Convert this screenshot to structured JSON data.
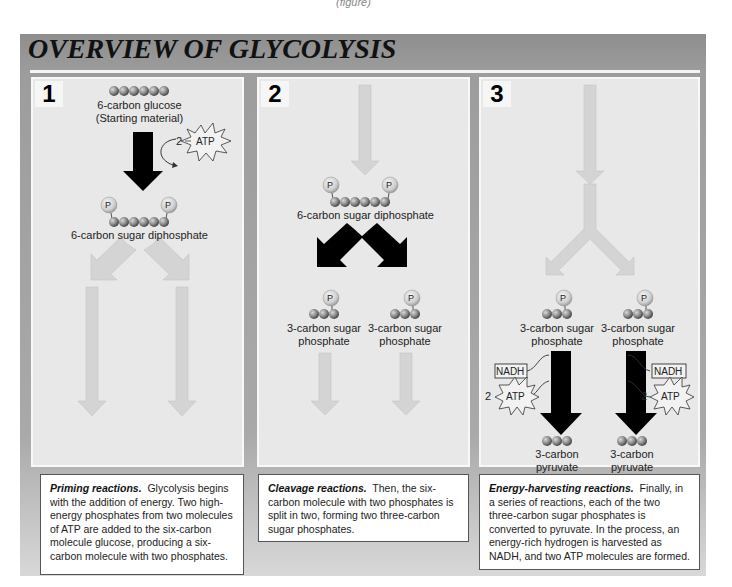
{
  "page": {
    "header_fragment": "(figure)",
    "title": "OVERVIEW OF GLYCOLYSIS",
    "colors": {
      "frame": "#9a9a9a",
      "panel": "#e8e8e8",
      "light_arrow": "#d4d4d4",
      "dark_arrow": "#000000",
      "phosphate": "#c8c8c8",
      "carbon": "#808080"
    }
  },
  "panels": [
    {
      "number": "1",
      "labels": {
        "glucose": "6-carbon glucose",
        "starting": "(Starting material)",
        "atp_count": "2",
        "atp": "ATP",
        "product": "6-carbon sugar diphosphate",
        "phosphate": "P"
      }
    },
    {
      "number": "2",
      "labels": {
        "input": "6-carbon sugar diphosphate",
        "phosphate": "P",
        "left_product_1": "3-carbon sugar",
        "left_product_2": "phosphate",
        "right_product_1": "3-carbon sugar",
        "right_product_2": "phosphate"
      }
    },
    {
      "number": "3",
      "labels": {
        "phosphate": "P",
        "left_input_1": "3-carbon sugar",
        "left_input_2": "phosphate",
        "right_input_1": "3-carbon sugar",
        "right_input_2": "phosphate",
        "nadh": "NADH",
        "atp_count": "2",
        "atp": "ATP",
        "left_output_1": "3-carbon",
        "left_output_2": "pyruvate",
        "right_output_1": "3-carbon",
        "right_output_2": "pyruvate"
      }
    }
  ],
  "captions": [
    {
      "heading": "Priming reactions.",
      "body": "Glycolysis begins with the addition of energy.  Two high-energy phosphates from two molecules of ATP are added to the six-carbon molecule glucose, producing a six-carbon molecule with two phosphates."
    },
    {
      "heading": "Cleavage reactions.",
      "body": "Then, the six-carbon molecule with two phosphates is split in two, forming two three-carbon sugar phosphates."
    },
    {
      "heading": "Energy-harvesting reactions.",
      "body": "Finally, in a series of reactions, each of the two three-carbon sugar phosphates is converted to pyruvate.  In the process, an energy-rich hydrogen is harvested as NADH, and two ATP molecules are formed."
    }
  ]
}
